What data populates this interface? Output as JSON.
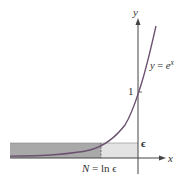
{
  "diagram": {
    "axes": {
      "x_label": "x",
      "y_label": "y"
    },
    "curve_label": "y = e^x",
    "curve_label_parts": {
      "lhs": "y",
      "eq": " = ",
      "base": "e",
      "exp": "x"
    },
    "tick_labels": {
      "one": "1",
      "epsilon": "ϵ"
    },
    "n_label": "N = ln ϵ",
    "n_label_parts": {
      "lhs": "N",
      "eq": " = ln ",
      "eps": "ϵ"
    },
    "colors": {
      "curve": "#6b5070",
      "axes": "#444444",
      "dark_region": "#a8a8a8",
      "light_region": "#e2e2e2",
      "dash": "#555555"
    }
  }
}
